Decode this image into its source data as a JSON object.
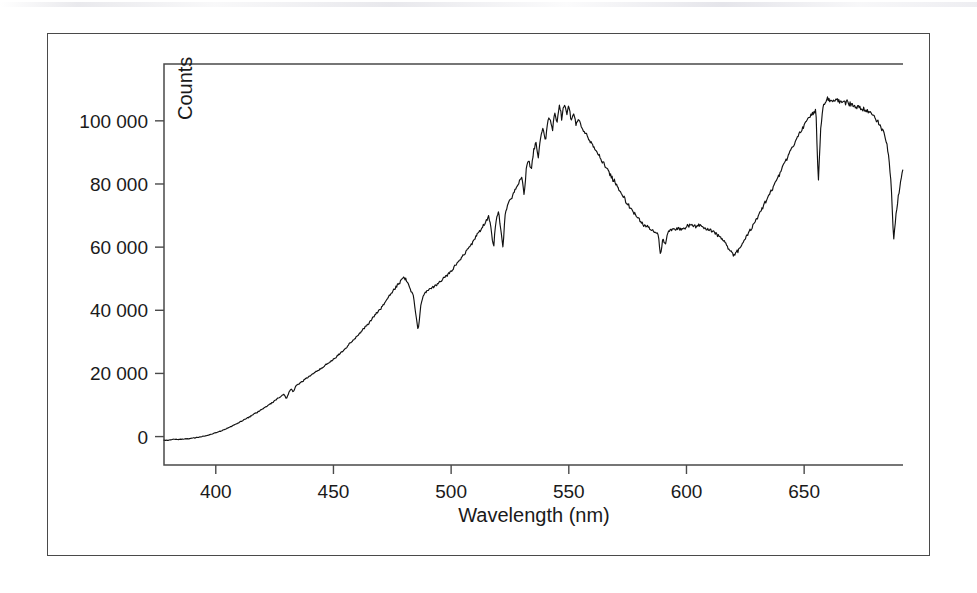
{
  "figure": {
    "background_color": "#ffffff",
    "frame_color": "#4a4a4a",
    "curve_color": "#111111",
    "has_outer_border": true,
    "scan_artifact_present": true
  },
  "chart_data": {
    "type": "line",
    "title": "",
    "subtitle": "",
    "xlabel": "Wavelength (nm)",
    "ylabel": "Counts",
    "xlim": [
      378,
      692
    ],
    "ylim": [
      -9000,
      118000
    ],
    "xticks": [
      400,
      450,
      500,
      550,
      600,
      650
    ],
    "xtick_labels": [
      "400",
      "450",
      "500",
      "550",
      "600",
      "650"
    ],
    "yticks": [
      0,
      20000,
      40000,
      60000,
      80000,
      100000
    ],
    "ytick_labels": [
      "0",
      "20 000",
      "40 000",
      "60 000",
      "80 000",
      "100 000"
    ],
    "grid": false,
    "legend": null,
    "annotations": [],
    "series": [
      {
        "name": "Spectrum",
        "color": "#111111",
        "x": [
          378,
          380,
          382,
          384,
          386,
          388,
          390,
          392,
          394,
          396,
          398,
          400,
          402,
          404,
          406,
          408,
          410,
          412,
          414,
          416,
          418,
          420,
          422,
          424,
          426,
          428,
          429,
          430,
          431,
          432,
          433,
          434,
          436,
          438,
          440,
          442,
          444,
          446,
          448,
          450,
          452,
          454,
          456,
          458,
          460,
          462,
          464,
          466,
          468,
          470,
          472,
          474,
          476,
          478,
          479,
          480,
          481,
          482,
          483,
          484,
          485,
          486,
          487,
          488,
          489,
          490,
          492,
          494,
          496,
          498,
          500,
          502,
          504,
          506,
          508,
          510,
          512,
          514,
          516,
          517,
          518,
          519,
          520,
          521,
          522,
          523,
          524,
          526,
          528,
          530,
          531,
          532,
          533,
          534,
          535,
          536,
          537,
          538,
          539,
          540,
          541,
          542,
          543,
          544,
          545,
          546,
          547,
          548,
          549,
          550,
          551,
          552,
          553,
          554,
          556,
          558,
          560,
          562,
          564,
          566,
          568,
          570,
          572,
          574,
          576,
          578,
          580,
          582,
          584,
          586,
          588,
          589,
          590,
          591,
          592,
          594,
          596,
          598,
          600,
          602,
          604,
          606,
          608,
          610,
          612,
          614,
          616,
          618,
          620,
          622,
          624,
          626,
          628,
          630,
          632,
          634,
          636,
          638,
          640,
          642,
          644,
          646,
          648,
          650,
          652,
          654,
          655,
          656,
          657,
          658,
          659,
          660,
          662,
          664,
          666,
          668,
          670,
          672,
          674,
          676,
          678,
          680,
          682,
          684,
          685,
          686,
          687,
          688,
          689,
          690,
          691,
          692
        ],
        "y": [
          -1200,
          -1100,
          -900,
          -900,
          -800,
          -700,
          -500,
          -300,
          0,
          300,
          700,
          1200,
          1700,
          2300,
          3000,
          3700,
          4500,
          5300,
          6100,
          7000,
          7900,
          8800,
          9800,
          10800,
          11900,
          12900,
          13400,
          11800,
          13900,
          15200,
          14100,
          15900,
          17000,
          18200,
          19200,
          20300,
          21200,
          22300,
          23400,
          24500,
          25800,
          27200,
          28700,
          30200,
          31800,
          33400,
          35100,
          36900,
          38700,
          40500,
          42600,
          44800,
          46800,
          48600,
          49800,
          50300,
          49600,
          47800,
          46200,
          44500,
          39000,
          33500,
          40800,
          44000,
          45600,
          46400,
          47200,
          48200,
          49400,
          50800,
          52400,
          54300,
          56200,
          58200,
          60300,
          62500,
          64800,
          67200,
          69800,
          66000,
          59500,
          68200,
          71500,
          66500,
          60000,
          70500,
          73500,
          76200,
          79000,
          82500,
          76500,
          85000,
          88000,
          84000,
          90500,
          93000,
          88500,
          95000,
          97500,
          93500,
          99000,
          101500,
          97000,
          103000,
          99500,
          104500,
          101000,
          105500,
          102000,
          104000,
          100500,
          102500,
          99000,
          100500,
          97500,
          95000,
          92500,
          90000,
          87500,
          85000,
          82500,
          80000,
          77500,
          75000,
          72500,
          70500,
          68500,
          67000,
          66000,
          65000,
          64000,
          57000,
          63000,
          60500,
          64500,
          65500,
          66000,
          65500,
          66500,
          67000,
          66500,
          67000,
          66000,
          65500,
          64500,
          63500,
          62000,
          59500,
          57500,
          59000,
          61500,
          64000,
          66500,
          69000,
          72000,
          75000,
          78000,
          81000,
          84000,
          87000,
          90000,
          93000,
          96000,
          98500,
          101000,
          102500,
          104000,
          80000,
          97000,
          104500,
          106500,
          107000,
          106000,
          106500,
          105500,
          106000,
          105000,
          104500,
          104000,
          103500,
          102500,
          101000,
          99000,
          96000,
          93000,
          88000,
          80000,
          62000,
          70000,
          76000,
          80500,
          84500
        ]
      }
    ],
    "features": {
      "description": "Daylight/solar spectrum with Fraunhofer absorption lines",
      "absorption_lines_nm": [
        430,
        485,
        517,
        522,
        589,
        656,
        687
      ],
      "peak_1_nm": 548,
      "peak_1_counts": 105500,
      "peak_2_nm": 658,
      "peak_2_counts": 107000,
      "local_minimum_nm": 620,
      "local_minimum_counts": 57500
    }
  }
}
